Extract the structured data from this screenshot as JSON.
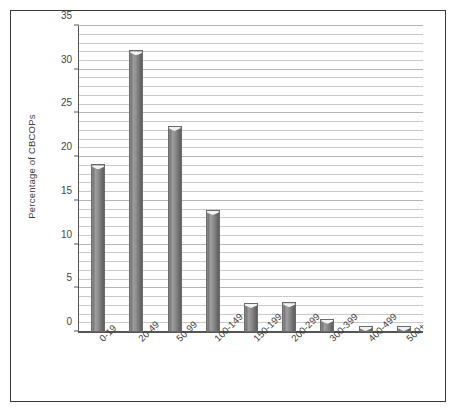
{
  "chart_data": {
    "type": "bar",
    "title": "",
    "xlabel": "",
    "ylabel": "Percentage of CBCOPs",
    "categories": [
      "0-19",
      "20-49",
      "50-99",
      "100-149",
      "150-199",
      "200-299",
      "300-399",
      "400-499",
      "500+"
    ],
    "values": [
      19.1,
      32.1,
      23.5,
      13.9,
      3.3,
      3.4,
      1.5,
      0.7,
      0.7
    ],
    "ylim": [
      0,
      35
    ],
    "y_major_ticks": [
      0,
      5,
      10,
      15,
      20,
      25,
      30,
      35
    ],
    "y_tick_labels": [
      "0",
      "5",
      "10",
      "15",
      "20",
      "25",
      "30",
      "35"
    ],
    "y_minor_interval": 1,
    "grid": "horizontal",
    "legend": "none",
    "orientation": "vertical",
    "colors": {
      "bar_fill_dark": "#6f6f6f",
      "bar_fill_light": "#9f9f9f",
      "bar_edge": "#6a6a6a",
      "gridline": "#c9c9c9",
      "axis": "#555555",
      "frame_border": "#3a3a3a",
      "text": "#3c3c3c",
      "background": "#ffffff"
    }
  }
}
